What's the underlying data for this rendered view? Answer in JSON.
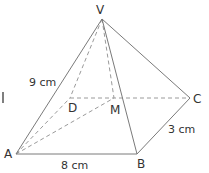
{
  "diagram": {
    "vertices": {
      "V": "V",
      "A": "A",
      "B": "B",
      "C": "C",
      "D": "D",
      "M": "M"
    },
    "measurements": {
      "VA": "9 cm",
      "AB": "8 cm",
      "BC": "3 cm"
    },
    "edges_visible": [
      "VA",
      "VB",
      "VC",
      "AB",
      "BC"
    ],
    "edges_hidden": [
      "VD",
      "VM",
      "AD",
      "DC",
      "AM"
    ],
    "colors": {
      "edge": "#7a7a7a",
      "hidden": "#9a9a9a",
      "text": "#333333"
    }
  }
}
